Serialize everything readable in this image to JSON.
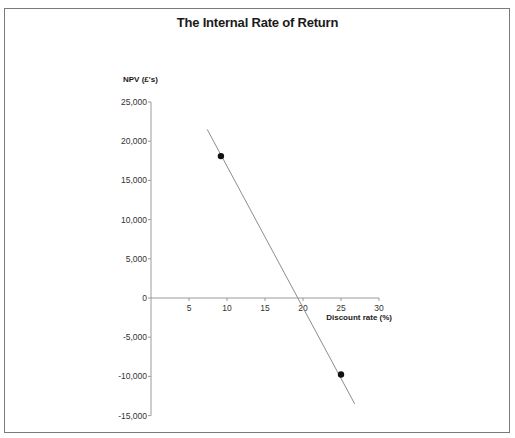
{
  "chart_data": {
    "type": "line",
    "title": "The Internal Rate of Return",
    "xlabel": "Discount rate (%)",
    "ylabel": "NPV (£'s)",
    "xlim": [
      0,
      30
    ],
    "ylim": [
      -15000,
      25000
    ],
    "x_ticks": [
      5,
      10,
      15,
      20,
      25,
      30
    ],
    "x_tick_labels": [
      "5",
      "10",
      "15",
      "20",
      "25",
      "30"
    ],
    "y_ticks": [
      25000,
      20000,
      15000,
      10000,
      5000,
      0,
      -5000,
      -10000,
      -15000
    ],
    "y_tick_labels": [
      "25,000",
      "20,000",
      "15,000",
      "10,000",
      "5,000",
      "0",
      "-5,000",
      "-10,000",
      "-15,000"
    ],
    "grid": false,
    "legend": null,
    "series": [
      {
        "name": "NPV line",
        "style": "line",
        "x": [
          7.4,
          26.8
        ],
        "y": [
          21500,
          -13500
        ]
      },
      {
        "name": "Calculated NPVs",
        "style": "points",
        "x": [
          9.2,
          25
        ],
        "y": [
          18100,
          -9750
        ]
      }
    ],
    "annotations": {
      "irr_crossing_x": 19.5
    }
  },
  "colors": {
    "axis": "#9a9a9a",
    "line": "#8c8c8c",
    "point": "#111111",
    "frame": "#7a7a7a"
  }
}
